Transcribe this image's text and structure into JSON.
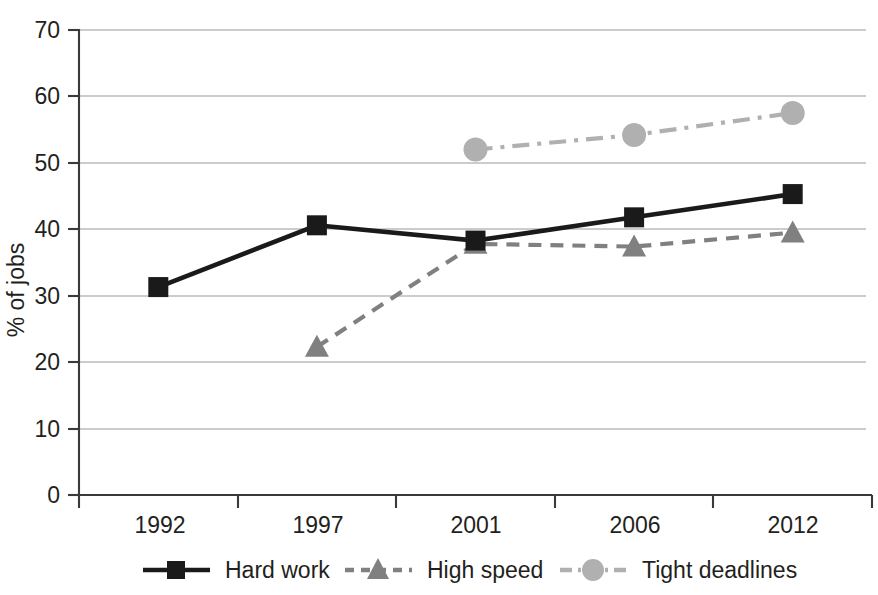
{
  "chart_data": {
    "type": "line",
    "title": "",
    "subtitle": "",
    "xlabel": "",
    "ylabel": "% of jobs",
    "categories": [
      "1992",
      "1997",
      "2001",
      "2006",
      "2012"
    ],
    "ylim": [
      0,
      70
    ],
    "ytick_step": 10,
    "yticks": [
      "0",
      "10",
      "20",
      "30",
      "40",
      "50",
      "60",
      "70"
    ],
    "grid": "horizontal",
    "legend_position": "bottom",
    "series": [
      {
        "name": "Hard work",
        "marker": "square",
        "color": "#1a1a1a",
        "linestyle": "solid",
        "values": [
          31.3,
          40.6,
          38.3,
          41.8,
          45.3
        ]
      },
      {
        "name": "High speed",
        "marker": "triangle",
        "color": "#808080",
        "linestyle": "dashed",
        "values": [
          null,
          22.3,
          37.8,
          37.4,
          39.5
        ]
      },
      {
        "name": "Tight deadlines",
        "marker": "circle",
        "color": "#b0b0b0",
        "linestyle": "dashdot",
        "values": [
          null,
          null,
          52.0,
          54.2,
          57.5
        ]
      }
    ]
  },
  "axis": {
    "y_title": "% of jobs",
    "y_tick_70": "70",
    "y_tick_60": "60",
    "y_tick_50": "50",
    "y_tick_40": "40",
    "y_tick_30": "30",
    "y_tick_20": "20",
    "y_tick_10": "10",
    "y_tick_0": "0",
    "x_tick_0": "1992",
    "x_tick_1": "1997",
    "x_tick_2": "2001",
    "x_tick_3": "2006",
    "x_tick_4": "2012"
  },
  "legend": {
    "item_0_label": "Hard work",
    "item_1_label": "High speed",
    "item_2_label": "Tight deadlines"
  },
  "colors": {
    "hard_work": "#1a1a1a",
    "high_speed": "#808080",
    "tight_deadlines": "#b0b0b0",
    "gridline": "#9a9a9a",
    "axis": "#3a3a3a",
    "text": "#231f20",
    "background": "#ffffff"
  }
}
